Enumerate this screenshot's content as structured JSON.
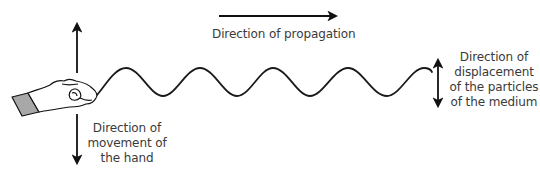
{
  "diagram": {
    "propagation": {
      "label": "Direction of propagation",
      "arrow": "right-arrow"
    },
    "hand_movement": {
      "lines": [
        "Direction of",
        "movement of",
        "the hand"
      ],
      "arrow": "up-down-arrow"
    },
    "particle_displacement": {
      "lines": [
        "Direction of",
        "displacement",
        "of the particles",
        "of the medium"
      ],
      "arrow": "up-down-arrow"
    },
    "wave": {
      "type": "sine",
      "cycles": 4.25,
      "color": "#1a1a1a"
    },
    "hand": {
      "icon": "hand-icon",
      "cuff_color": "#a8a8a8"
    },
    "colors": {
      "line": "#111111",
      "text": "#3a3a3a"
    }
  }
}
